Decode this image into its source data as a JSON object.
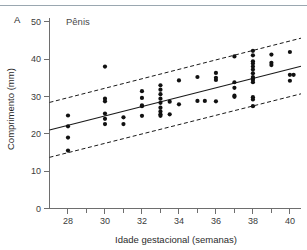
{
  "figure": {
    "panel_label": "A",
    "series_label": "Pênis"
  },
  "chart_data": {
    "type": "scatter",
    "title": "Pênis",
    "panel": "A",
    "xlabel": "Idade gestacional (semanas)",
    "ylabel": "Comprimento (mm)",
    "xlim": [
      27,
      40.6
    ],
    "ylim": [
      0,
      51
    ],
    "xticks": [
      28,
      30,
      32,
      34,
      36,
      38,
      40
    ],
    "xticklabels": [
      "28",
      "30",
      "32",
      "34",
      "36",
      "38",
      "40"
    ],
    "xminorticks": [
      29,
      31,
      33,
      35,
      37,
      39
    ],
    "yticks": [
      0,
      10,
      20,
      30,
      40,
      50
    ],
    "yticklabels": [
      "0",
      "10",
      "20",
      "30",
      "40",
      "50"
    ],
    "grid": false,
    "legend": false,
    "point_color": "#111111",
    "line_color": "#1a1a1a",
    "marker": "circle",
    "marker_size": 2.1,
    "points": [
      {
        "x": 28,
        "y": 24.9
      },
      {
        "x": 28,
        "y": 22.0
      },
      {
        "x": 28,
        "y": 19.0
      },
      {
        "x": 28,
        "y": 15.5
      },
      {
        "x": 30,
        "y": 38.0
      },
      {
        "x": 30,
        "y": 29.4
      },
      {
        "x": 30,
        "y": 28.7
      },
      {
        "x": 30,
        "y": 25.4
      },
      {
        "x": 30,
        "y": 24.0
      },
      {
        "x": 30,
        "y": 22.6
      },
      {
        "x": 31,
        "y": 24.4
      },
      {
        "x": 31,
        "y": 22.6
      },
      {
        "x": 32,
        "y": 31.4
      },
      {
        "x": 32,
        "y": 29.6
      },
      {
        "x": 32,
        "y": 27.6
      },
      {
        "x": 32,
        "y": 27.4
      },
      {
        "x": 32,
        "y": 24.8
      },
      {
        "x": 33,
        "y": 33.0
      },
      {
        "x": 33,
        "y": 31.8
      },
      {
        "x": 33,
        "y": 30.6
      },
      {
        "x": 33,
        "y": 29.4
      },
      {
        "x": 33,
        "y": 28.3
      },
      {
        "x": 33,
        "y": 27.0
      },
      {
        "x": 33,
        "y": 26.0
      },
      {
        "x": 33,
        "y": 25.2
      },
      {
        "x": 33,
        "y": 24.8
      },
      {
        "x": 33.5,
        "y": 28.6
      },
      {
        "x": 33.5,
        "y": 25.2
      },
      {
        "x": 34,
        "y": 34.3
      },
      {
        "x": 34,
        "y": 27.9
      },
      {
        "x": 35,
        "y": 35.2
      },
      {
        "x": 35,
        "y": 28.8
      },
      {
        "x": 35.4,
        "y": 28.8
      },
      {
        "x": 36,
        "y": 36.3
      },
      {
        "x": 36,
        "y": 35.0
      },
      {
        "x": 36,
        "y": 34.4
      },
      {
        "x": 36,
        "y": 28.7
      },
      {
        "x": 37,
        "y": 40.7
      },
      {
        "x": 37,
        "y": 33.8
      },
      {
        "x": 37,
        "y": 32.3
      },
      {
        "x": 37,
        "y": 30.2
      },
      {
        "x": 37,
        "y": 29.9
      },
      {
        "x": 38,
        "y": 42.2
      },
      {
        "x": 38,
        "y": 41.0
      },
      {
        "x": 38,
        "y": 39.4
      },
      {
        "x": 38,
        "y": 38.8
      },
      {
        "x": 38,
        "y": 38.0
      },
      {
        "x": 38,
        "y": 37.2
      },
      {
        "x": 38,
        "y": 36.2
      },
      {
        "x": 38,
        "y": 35.2
      },
      {
        "x": 38,
        "y": 34.8
      },
      {
        "x": 38,
        "y": 34.4
      },
      {
        "x": 38,
        "y": 33.8
      },
      {
        "x": 38,
        "y": 29.8
      },
      {
        "x": 38,
        "y": 29.2
      },
      {
        "x": 38,
        "y": 27.4
      },
      {
        "x": 39,
        "y": 41.2
      },
      {
        "x": 39,
        "y": 39.0
      },
      {
        "x": 39,
        "y": 38.4
      },
      {
        "x": 40,
        "y": 41.9
      },
      {
        "x": 40,
        "y": 35.8
      },
      {
        "x": 40.2,
        "y": 35.8
      },
      {
        "x": 40,
        "y": 34.2
      }
    ],
    "fit_line": {
      "style": "solid",
      "x": [
        27,
        40.6
      ],
      "y": [
        21.0,
        38.1
      ]
    },
    "upper_band": {
      "style": "dashed",
      "x": [
        27,
        40.6
      ],
      "y": [
        28.4,
        45.6
      ]
    },
    "lower_band": {
      "style": "dashed",
      "x": [
        27,
        40.6
      ],
      "y": [
        13.7,
        30.7
      ]
    }
  }
}
